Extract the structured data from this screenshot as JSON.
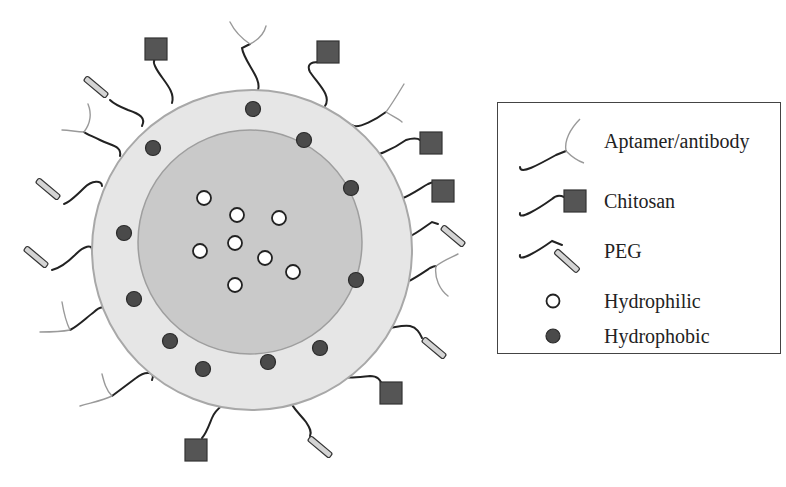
{
  "figure": {
    "colors": {
      "outer_shell": "#e6e6e6",
      "inner_core": "#c9c9c9",
      "shell_border": "#a8a8a8",
      "hydrophobic": "#4a4a4a",
      "hydrophilic": "#ffffff",
      "chitosan": "#555555",
      "peg": "#d4d4d4",
      "aptamer": "#9a9a9a",
      "linker": "#222222"
    }
  },
  "legend": {
    "items": [
      {
        "icon": "aptamer-antibody-icon",
        "label": "Aptamer/antibody"
      },
      {
        "icon": "chitosan-icon",
        "label": "Chitosan"
      },
      {
        "icon": "peg-icon",
        "label": "PEG"
      },
      {
        "icon": "hydrophilic-icon",
        "label": "Hydrophilic"
      },
      {
        "icon": "hydrophobic-icon",
        "label": "Hydrophobic"
      }
    ]
  }
}
